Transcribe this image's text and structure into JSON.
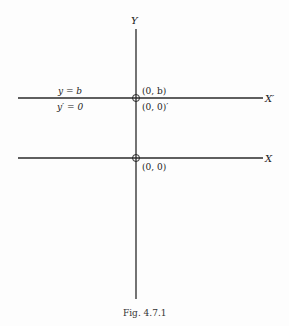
{
  "figure": {
    "caption": "Fig. 4.7.1",
    "axes": {
      "y_label": "Y",
      "x_label": "X",
      "x_prime_label": "X′"
    },
    "points": {
      "upper_top": "(0, b)",
      "upper_bottom": "(0, 0)′",
      "lower": "(0, 0)"
    },
    "equations": {
      "line1": "y = b",
      "line2": "y′ = 0"
    },
    "colors": {
      "line": "#2a2a2a",
      "background": "#fdfdfd"
    }
  }
}
